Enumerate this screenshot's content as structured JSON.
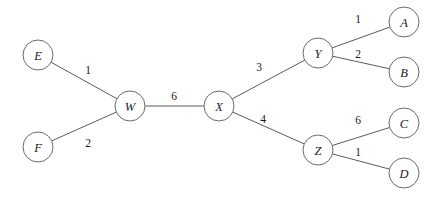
{
  "figure": {
    "width": 443,
    "height": 202,
    "background_color": "#ffffff",
    "node_stroke_color": "#6a6a6a",
    "node_fill_color": "#ffffff",
    "edge_stroke_color": "#5b5b5b",
    "text_color": "#1a1a1a"
  },
  "nodes": [
    {
      "id": "E",
      "label": "E",
      "cx": 38,
      "cy": 55,
      "r": 15
    },
    {
      "id": "F",
      "label": "F",
      "cx": 38,
      "cy": 147,
      "r": 15
    },
    {
      "id": "W",
      "label": "W",
      "cx": 130,
      "cy": 106,
      "r": 15
    },
    {
      "id": "X",
      "label": "X",
      "cx": 219,
      "cy": 106,
      "r": 15
    },
    {
      "id": "Y",
      "label": "Y",
      "cx": 318,
      "cy": 53,
      "r": 15
    },
    {
      "id": "Z",
      "label": "Z",
      "cx": 318,
      "cy": 150,
      "r": 15
    },
    {
      "id": "A",
      "label": "A",
      "cx": 404,
      "cy": 22,
      "r": 15
    },
    {
      "id": "B",
      "label": "B",
      "cx": 404,
      "cy": 72,
      "r": 15
    },
    {
      "id": "C",
      "label": "C",
      "cx": 404,
      "cy": 123,
      "r": 15
    },
    {
      "id": "D",
      "label": "D",
      "cx": 404,
      "cy": 173,
      "r": 15
    }
  ],
  "edges": [
    {
      "id": "E-W",
      "source": "E",
      "target": "W",
      "weight": "1",
      "label_x": 88,
      "label_y": 70
    },
    {
      "id": "F-W",
      "source": "F",
      "target": "W",
      "weight": "2",
      "label_x": 88,
      "label_y": 143
    },
    {
      "id": "W-X",
      "source": "W",
      "target": "X",
      "weight": "6",
      "label_x": 174,
      "label_y": 96
    },
    {
      "id": "X-Y",
      "source": "X",
      "target": "Y",
      "weight": "3",
      "label_x": 259,
      "label_y": 67
    },
    {
      "id": "X-Z",
      "source": "X",
      "target": "Z",
      "weight": "4",
      "label_x": 263,
      "label_y": 119
    },
    {
      "id": "Y-A",
      "source": "Y",
      "target": "A",
      "weight": "1",
      "label_x": 358,
      "label_y": 19
    },
    {
      "id": "Y-B",
      "source": "Y",
      "target": "B",
      "weight": "2",
      "label_x": 358,
      "label_y": 54
    },
    {
      "id": "Z-C",
      "source": "Z",
      "target": "C",
      "weight": "6",
      "label_x": 358,
      "label_y": 120
    },
    {
      "id": "Z-D",
      "source": "Z",
      "target": "D",
      "weight": "1",
      "label_x": 358,
      "label_y": 152
    }
  ]
}
